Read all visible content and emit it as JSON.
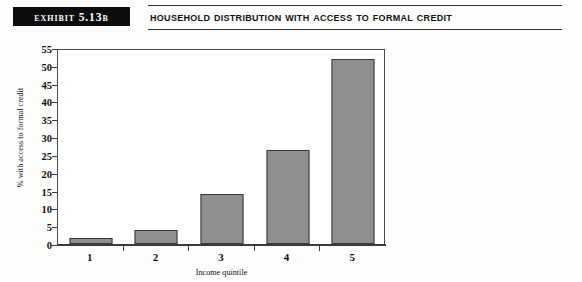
{
  "header": {
    "exhibit_label": "EXHIBIT 5.13B",
    "title": "HOUSEHOLD DISTRIBUTION WITH ACCESS TO FORMAL CREDIT"
  },
  "chart_data": {
    "type": "bar",
    "title": "Household Distribution with Access to Formal Credit",
    "categories": [
      "1",
      "2",
      "3",
      "4",
      "5"
    ],
    "values": [
      1.8,
      3.8,
      14.0,
      26.5,
      52.0
    ],
    "xlabel": "Income quintile",
    "ylabel": "% with access to formal credit",
    "ylim": [
      0,
      55
    ],
    "ytick_step": 5,
    "yticks": [
      "0",
      "5",
      "10",
      "15",
      "20",
      "25",
      "30",
      "35",
      "40",
      "45",
      "50",
      "55"
    ],
    "grid": false,
    "legend": null,
    "bar_color": "#8f8f8f",
    "bar_edge_color": "#3a3a3a"
  }
}
